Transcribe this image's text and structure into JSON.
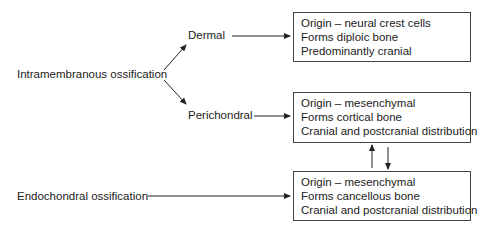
{
  "diagram": {
    "sources": {
      "intramembranous": "Intramembranous ossification",
      "endochondral": "Endochondral ossification"
    },
    "branches": {
      "dermal": "Dermal",
      "perichondral": "Perichondral"
    },
    "boxes": [
      {
        "lines": [
          "Origin – neural crest cells",
          "Forms diploic bone",
          "Predominantly cranial"
        ]
      },
      {
        "lines": [
          "Origin – mesenchymal",
          "Forms cortical bone",
          "Cranial and postcranial distribution"
        ]
      },
      {
        "lines": [
          "Origin – mesenchymal",
          "Forms cancellous bone",
          "Cranial and postcranial distribution"
        ]
      }
    ],
    "connections": [
      {
        "from": "Intramembranous ossification",
        "to": "Dermal"
      },
      {
        "from": "Intramembranous ossification",
        "to": "Perichondral"
      },
      {
        "from": "Dermal",
        "to": "box-1"
      },
      {
        "from": "Perichondral",
        "to": "box-2"
      },
      {
        "from": "Endochondral ossification",
        "to": "box-3"
      },
      {
        "from": "box-3",
        "to": "box-2"
      },
      {
        "from": "box-2",
        "to": "box-3"
      }
    ]
  }
}
